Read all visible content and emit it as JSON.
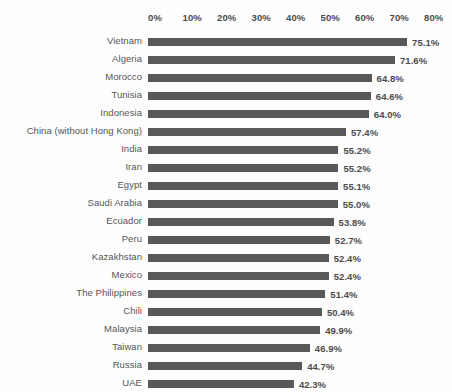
{
  "chart_data": {
    "type": "bar",
    "orientation": "horizontal",
    "title": "",
    "subtitle": "",
    "xlabel": "",
    "ylabel": "",
    "xlim": [
      0,
      80
    ],
    "grid": false,
    "legend": null,
    "axis_ticks": [
      "0%",
      "10%",
      "20%",
      "30%",
      "40%",
      "50%",
      "60%",
      "70%",
      "80%"
    ],
    "axis_tick_values": [
      0,
      10,
      20,
      30,
      40,
      50,
      60,
      70,
      80
    ],
    "bar_color": "#595959",
    "background_color": "#fdfdfd",
    "categories": [
      "Vietnam",
      "Algeria",
      "Morocco",
      "Tunisia",
      "Indonesia",
      "China (without Hong Kong)",
      "India",
      "Iran",
      "Egypt",
      "Saudi Arabia",
      "Ecuador",
      "Peru",
      "Kazakhstan",
      "Mexico",
      "The Philippines",
      "Chili",
      "Malaysia",
      "Taiwan",
      "Russia",
      "UAE"
    ],
    "values": [
      75.1,
      71.6,
      64.8,
      64.6,
      64.0,
      57.4,
      55.2,
      55.2,
      55.1,
      55.0,
      53.8,
      52.7,
      52.4,
      52.4,
      51.4,
      50.4,
      49.9,
      46.9,
      44.7,
      42.3
    ],
    "value_labels": [
      "75.1%",
      "71.6%",
      "64.8%",
      "64.6%",
      "64.0%",
      "57.4%",
      "55.2%",
      "55.2%",
      "55.1%",
      "55.0%",
      "53.8%",
      "52.7%",
      "52.4%",
      "52.4%",
      "51.4%",
      "50.4%",
      "49.9%",
      "46.9%",
      "44.7%",
      "42.3%"
    ]
  }
}
